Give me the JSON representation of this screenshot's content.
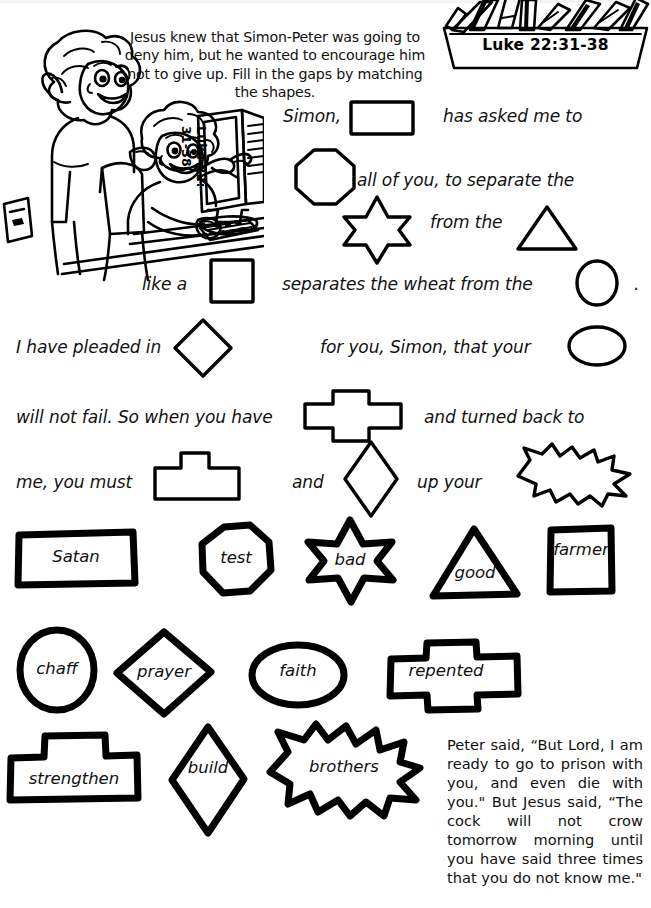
{
  "worksheet": {
    "intro": "Jesus knew that Simon-Peter was going to deny him, but he wanted to encourage him not to give up. Fill in the gaps by matching the shapes.",
    "verse_reference": "Luke 22:31-38",
    "monitor_line1": "Luke 22:",
    "monitor_line2": "31-38",
    "closing_text": "Peter said, “But Lord, I am ready to go to prison with you, and even die with you.\" But Jesus said, “The cock will not crow tomorrow morning until you have said three times that you do not know me.\""
  },
  "sentence_fragments": {
    "f1": "Simon,",
    "f2": "has asked me to",
    "f3": "all of you, to separate the",
    "f4": "from the",
    "f5": "like a",
    "f6": "separates the wheat from the",
    "f7": ".",
    "f8": "I have pleaded in",
    "f9": "for you, Simon, that your",
    "f10": "will not fail.  So when you have",
    "f11": "and turned back to",
    "f12": "me, you must",
    "f13": "and",
    "f14": "up your"
  },
  "blank_shapes": [
    {
      "name": "rectangle-blank",
      "answer_shape": "rectangle"
    },
    {
      "name": "octagon-blank",
      "answer_shape": "octagon"
    },
    {
      "name": "star-blank",
      "answer_shape": "six-point-star"
    },
    {
      "name": "triangle-blank",
      "answer_shape": "triangle"
    },
    {
      "name": "square-blank",
      "answer_shape": "square"
    },
    {
      "name": "circle-blank",
      "answer_shape": "circle"
    },
    {
      "name": "diamond-blank",
      "answer_shape": "diamond"
    },
    {
      "name": "oval-blank",
      "answer_shape": "oval"
    },
    {
      "name": "cross-blank",
      "answer_shape": "cross"
    },
    {
      "name": "plinth-blank",
      "answer_shape": "plinth"
    },
    {
      "name": "tall-diamond-blank",
      "answer_shape": "tall-diamond"
    },
    {
      "name": "burst-blank",
      "answer_shape": "burst"
    }
  ],
  "word_bank": {
    "row1": [
      {
        "word": "Satan",
        "shape": "rectangle"
      },
      {
        "word": "test",
        "shape": "octagon"
      },
      {
        "word": "bad",
        "shape": "six-point-star"
      },
      {
        "word": "good",
        "shape": "triangle"
      },
      {
        "word": "farmer",
        "shape": "square"
      }
    ],
    "row2": [
      {
        "word": "chaff",
        "shape": "circle"
      },
      {
        "word": "prayer",
        "shape": "diamond"
      },
      {
        "word": "faith",
        "shape": "oval"
      },
      {
        "word": "repented",
        "shape": "cross"
      }
    ],
    "row3": [
      {
        "word": "strengthen",
        "shape": "plinth"
      },
      {
        "word": "build",
        "shape": "tall-diamond"
      },
      {
        "word": "brothers",
        "shape": "burst"
      }
    ]
  },
  "colors": {
    "ink": "#000000",
    "paper": "#ffffff"
  }
}
